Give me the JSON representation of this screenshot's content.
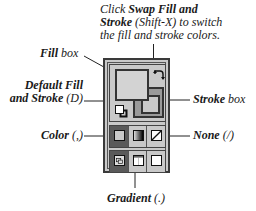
{
  "caption": {
    "line1_pre": "Click ",
    "line1_bold": "Swap Fill and",
    "line2_bold": "Stroke",
    "line2_post": " (Shift-X) to switch",
    "line3": "the fill and stroke colors."
  },
  "labels": {
    "fill_box_bold": "Fill",
    "fill_box_rest": " box",
    "default_line1": "Default Fill",
    "default_line2": "and Stroke (D)",
    "stroke_box_bold": "Stroke",
    "stroke_box_rest": " box",
    "color": "Color (,)",
    "none": "None (/)",
    "gradient": "Gradient (.)"
  },
  "panel": {
    "fill_color": "#d3d3d3",
    "stroke_color": "#9a9a9a",
    "mode_row": [
      {
        "name": "Color",
        "icon": "color-swatch-icon",
        "selected": true
      },
      {
        "name": "Gradient",
        "icon": "gradient-swatch-icon",
        "selected": false
      },
      {
        "name": "None",
        "icon": "none-swatch-icon",
        "selected": false
      }
    ],
    "view_row": [
      {
        "name": "Standard screen mode",
        "icon": "standard-mode-icon",
        "selected": true
      },
      {
        "name": "Full screen mode with menu bar",
        "icon": "fullscreen-menu-icon",
        "selected": false
      },
      {
        "name": "Full screen mode",
        "icon": "fullscreen-icon",
        "selected": false
      }
    ]
  }
}
